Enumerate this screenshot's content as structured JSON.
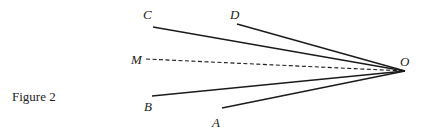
{
  "figure": {
    "caption": "Figure 2",
    "vertex": {
      "id": "O",
      "label": "O"
    },
    "rays": [
      {
        "id": "C",
        "label": "C",
        "style": "solid"
      },
      {
        "id": "D",
        "label": "D",
        "style": "solid"
      },
      {
        "id": "M",
        "label": "M",
        "style": "dashed"
      },
      {
        "id": "B",
        "label": "B",
        "style": "solid"
      },
      {
        "id": "A",
        "label": "A",
        "style": "solid"
      }
    ]
  }
}
